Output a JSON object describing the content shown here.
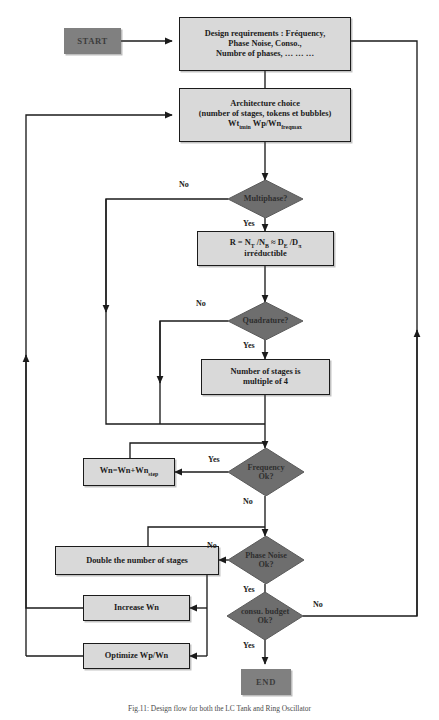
{
  "figure": {
    "caption": "Fig.11: Design flow for both the LC Tank and Ring Oscillator"
  },
  "nodes": {
    "start": {
      "label": "START",
      "shape": "terminator"
    },
    "design_requirements": {
      "line1": "Design requirements : Fréquency,",
      "line2": "Phase Noise, Conso.,",
      "line3": "Numbre of phases, … … …",
      "shape": "process"
    },
    "architecture_choice": {
      "line1": "Architecture choice",
      "line2": "(number of stages, tokens et bubbles)",
      "line3_a": "Wt",
      "line3_a_sub": "tmin",
      "line3_b": "Wp/Wn",
      "line3_b_sub": "freqmax",
      "shape": "process"
    },
    "multiphase": {
      "label": "Multiphase?",
      "shape": "decision"
    },
    "ratio_formula": {
      "line1": "R = N₁ /N₂ ≈ Dₑ /Dₓ",
      "r": "R = N",
      "r_sub1": "T",
      "r_mid": " /N",
      "r_sub2": "B",
      "r_eq": " ≈ D",
      "r_sub3": "E",
      "r_mid2": " /D",
      "r_sub4": "π",
      "line2": "irréductible",
      "shape": "process"
    },
    "quadrature": {
      "label": "Quadrature?",
      "shape": "decision"
    },
    "stages_multiple": {
      "line1": "Number of stages is",
      "line2": "multiple of 4",
      "shape": "process"
    },
    "frequency_ok": {
      "line1": "Frequency",
      "line2": "Ok?",
      "shape": "decision"
    },
    "increment_wn": {
      "a": "Wn=Wn+Wn",
      "a_sub": "step",
      "shape": "process"
    },
    "phase_noise_ok": {
      "line1": "Phase Noise",
      "line2": "Ok?",
      "shape": "decision"
    },
    "double_stages": {
      "label": "Double the number of stages",
      "shape": "process"
    },
    "increase_wn": {
      "label": "Increase Wn",
      "shape": "process"
    },
    "optimize_wpwn": {
      "label": "Optimize Wp/Wn",
      "shape": "process"
    },
    "consu_budget_ok": {
      "line1": "consu. budget",
      "line2": "Ok?",
      "shape": "decision"
    },
    "end": {
      "label": "END",
      "shape": "terminator"
    }
  },
  "edge_labels": {
    "multiphase_no": "No",
    "multiphase_yes": "Yes",
    "quadrature_no": "No",
    "quadrature_yes": "Yes",
    "frequency_yes": "Yes",
    "frequency_no": "No",
    "phase_noise_no": "No",
    "phase_noise_yes": "Yes",
    "consu_no": "No",
    "consu_yes": "Yes"
  },
  "colors": {
    "process_fill": "#d9d9d9",
    "decision_fill": "#6e6e6e",
    "terminator_fill": "#808080",
    "stroke": "#1b1b1b",
    "page_bg": "#ffffff"
  }
}
